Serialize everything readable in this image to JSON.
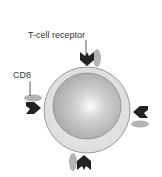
{
  "diagram": {
    "labels": {
      "tcr": "T-cell receptor",
      "cd8": "CD8"
    },
    "colors": {
      "background": "#ffffff",
      "cell_outer": "#e4e4e4",
      "cell_outline": "#9a9a9a",
      "nucleus_center": "#ffffff",
      "nucleus_edge": "#a8a8a8",
      "receptor": "#222222",
      "cd8_molecule": "#b0b0b0",
      "label_text": "#333333"
    },
    "components": [
      {
        "name": "cell-membrane",
        "type": "circle"
      },
      {
        "name": "nucleus",
        "type": "circle"
      },
      {
        "name": "t-cell-receptor",
        "count": 4,
        "positions": [
          "top",
          "left",
          "right",
          "bottom"
        ]
      },
      {
        "name": "cd8-molecule",
        "count": 4,
        "positions": [
          "top",
          "left",
          "right",
          "bottom"
        ]
      }
    ]
  }
}
